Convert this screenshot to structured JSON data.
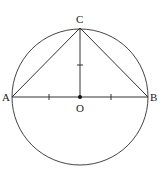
{
  "diagram": {
    "title": "",
    "circle": {
      "cx": 80,
      "cy": 97,
      "r": 68,
      "stroke": "#444444"
    },
    "points": [
      {
        "id": "A",
        "label": "A",
        "x": 12,
        "y": 97,
        "label_x": 2,
        "label_y": 101
      },
      {
        "id": "B",
        "label": "B",
        "x": 148,
        "y": 97,
        "label_x": 150,
        "label_y": 101
      },
      {
        "id": "C",
        "label": "C",
        "x": 80,
        "y": 28,
        "label_x": 76,
        "label_y": 23
      },
      {
        "id": "O",
        "label": "O",
        "x": 80,
        "y": 97,
        "label_x": 76,
        "label_y": 112
      }
    ],
    "segments": [
      "AB",
      "AC",
      "BC",
      "OC"
    ],
    "tick_marks": [
      {
        "on": "AO",
        "x": 49,
        "y": 97,
        "orient": "vertical"
      },
      {
        "on": "OB",
        "x": 111,
        "y": 97,
        "orient": "vertical"
      },
      {
        "on": "OC",
        "x": 80,
        "y": 65,
        "orient": "horizontal"
      }
    ]
  }
}
